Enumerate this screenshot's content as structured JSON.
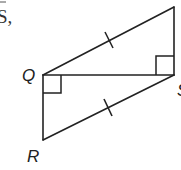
{
  "fragment_text": "S,",
  "labels": {
    "q": "Q",
    "r": "R",
    "s": "S"
  },
  "colors": {
    "stroke": "#222222",
    "background": "#ffffff"
  },
  "diagram": {
    "type": "geometry",
    "points": {
      "T": [
        174,
        7
      ],
      "Q": [
        43,
        75
      ],
      "S": [
        174,
        75
      ],
      "R": [
        43,
        140
      ]
    },
    "segments": [
      "QT",
      "TS",
      "QS",
      "QR",
      "RS"
    ],
    "right_angles": [
      "RQS",
      "TSQ"
    ],
    "congruence_marks": [
      "QT",
      "RS"
    ]
  }
}
